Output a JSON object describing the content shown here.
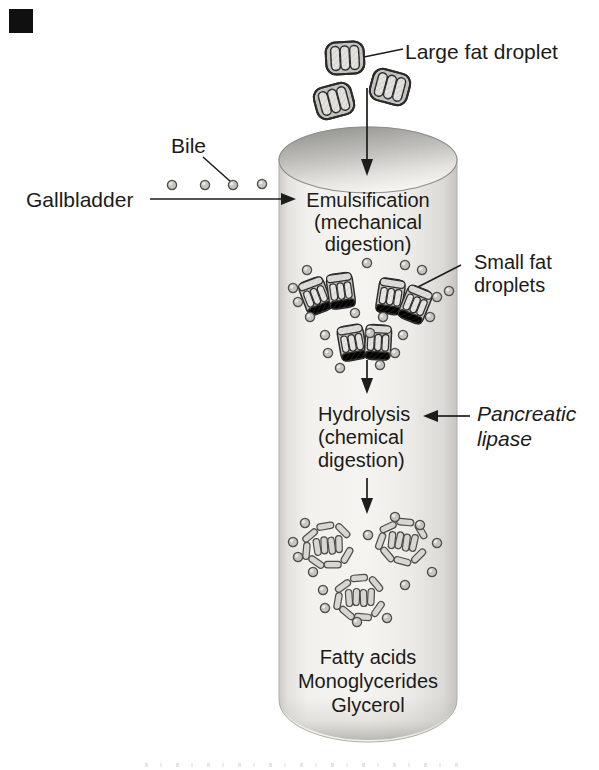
{
  "figure": {
    "colors": {
      "background": "#ffffff",
      "ink": "#1b1b19",
      "cylinder_light": "#f5f4f0",
      "cylinder_edge": "#c6c5c2",
      "cylinder_mouth_dark": "#94948f",
      "droplet_fill": "#c6c5c1",
      "droplet_bar": "#e6e5e1",
      "outline": "#2b2b29"
    },
    "labels": {
      "large_fat_droplet": "Large fat droplet",
      "bile": "Bile",
      "gallbladder": "Gallbladder",
      "emulsification_line1": "Emulsification",
      "emulsification_line2": "(mechanical",
      "emulsification_line3": "digestion)",
      "small_fat_line1": "Small fat",
      "small_fat_line2": "droplets",
      "hydrolysis_line1": "Hydrolysis",
      "hydrolysis_line2": "(chemical",
      "hydrolysis_line3": "digestion)",
      "pancreatic_line1": "Pancreatic",
      "pancreatic_line2": "lipase",
      "products_line1": "Fatty acids",
      "products_line2": "Monoglycerides",
      "products_line3": "Glycerol"
    }
  }
}
